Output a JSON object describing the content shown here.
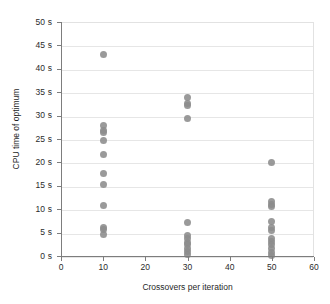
{
  "chart_data": {
    "type": "scatter",
    "title": "",
    "xlabel": "Crossovers per iteration",
    "ylabel": "CPU time of optimum",
    "xlim": [
      0,
      60
    ],
    "ylim": [
      0,
      50
    ],
    "grid": "horizontal",
    "legend": "none",
    "marker_color": "#8c8c8c",
    "xticks": [
      0,
      10,
      20,
      30,
      40,
      50,
      60
    ],
    "xtick_labels": [
      "0",
      "10",
      "20",
      "30",
      "40",
      "50",
      "60"
    ],
    "yticks": [
      0,
      5,
      10,
      15,
      20,
      25,
      30,
      35,
      40,
      45,
      50
    ],
    "ytick_labels": [
      "0 s",
      "5 s",
      "10 s",
      "15 s",
      "20 s",
      "25 s",
      "30 s",
      "35 s",
      "40 s",
      "45 s",
      "50 s"
    ],
    "series": [
      {
        "name": "CPU time of optimum",
        "points": [
          {
            "x": 10,
            "y": 43.2
          },
          {
            "x": 10,
            "y": 28.0
          },
          {
            "x": 10,
            "y": 27.1
          },
          {
            "x": 10,
            "y": 26.6
          },
          {
            "x": 10,
            "y": 24.9
          },
          {
            "x": 10,
            "y": 21.8
          },
          {
            "x": 10,
            "y": 17.8
          },
          {
            "x": 10,
            "y": 15.4
          },
          {
            "x": 10,
            "y": 10.9
          },
          {
            "x": 10,
            "y": 6.4
          },
          {
            "x": 10,
            "y": 5.8
          },
          {
            "x": 10,
            "y": 4.9
          },
          {
            "x": 30,
            "y": 34.0
          },
          {
            "x": 30,
            "y": 32.9
          },
          {
            "x": 30,
            "y": 32.3
          },
          {
            "x": 30,
            "y": 29.5
          },
          {
            "x": 30,
            "y": 7.4
          },
          {
            "x": 30,
            "y": 4.5
          },
          {
            "x": 30,
            "y": 3.9
          },
          {
            "x": 30,
            "y": 3.2
          },
          {
            "x": 30,
            "y": 2.6
          },
          {
            "x": 30,
            "y": 1.9
          },
          {
            "x": 30,
            "y": 1.1
          },
          {
            "x": 30,
            "y": 0.5
          },
          {
            "x": 50,
            "y": 20.2
          },
          {
            "x": 50,
            "y": 11.9
          },
          {
            "x": 50,
            "y": 11.2
          },
          {
            "x": 50,
            "y": 10.7
          },
          {
            "x": 50,
            "y": 7.5
          },
          {
            "x": 50,
            "y": 6.4
          },
          {
            "x": 50,
            "y": 5.6
          },
          {
            "x": 50,
            "y": 4.0
          },
          {
            "x": 50,
            "y": 3.3
          },
          {
            "x": 50,
            "y": 2.6
          },
          {
            "x": 50,
            "y": 1.8
          },
          {
            "x": 50,
            "y": 1.0
          },
          {
            "x": 50,
            "y": 0.4
          }
        ]
      }
    ]
  }
}
